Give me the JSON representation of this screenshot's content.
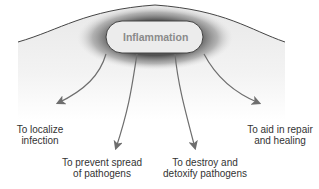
{
  "diagram": {
    "center_label": "Inflammation",
    "outcomes": [
      {
        "line1": "To localize",
        "line2": "infection"
      },
      {
        "line1": "To prevent spread",
        "line2": "of pathogens"
      },
      {
        "line1": "To destroy and",
        "line2": "detoxify pathogens"
      },
      {
        "line1": "To aid in repair",
        "line2": "and healing"
      }
    ],
    "colors": {
      "tissue_top": "#ededed",
      "tissue_bottom": "#ffffff",
      "halo": "#5a5a5a",
      "capsule_fill": "#ececec",
      "outline": "#444444",
      "arrow": "#6e6e6e",
      "text": "#333333"
    }
  }
}
